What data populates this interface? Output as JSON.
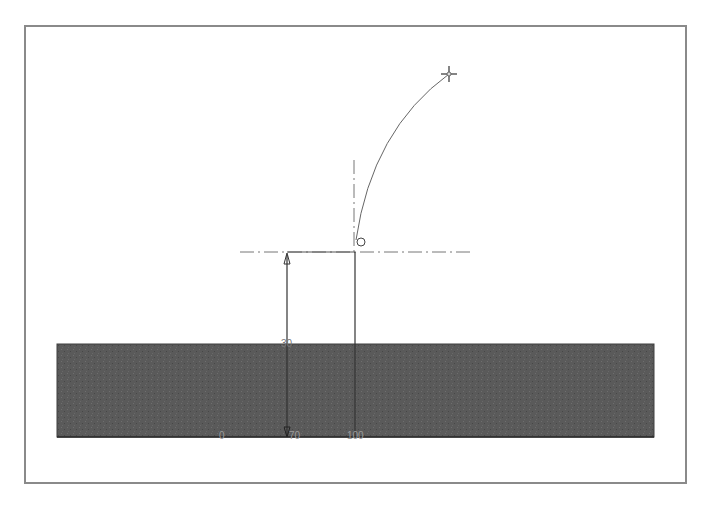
{
  "drawing": {
    "type": "cad-sketch",
    "colors": {
      "frame": "#8a8a8a",
      "ground_fill": "#5a5a5a",
      "line": "#444444",
      "centerline": "#777777",
      "label": "#9a9a9a"
    },
    "ground_block": {
      "x": 57,
      "y": 344,
      "width": 597,
      "height": 93
    },
    "centerline_horizontal": {
      "x1": 240,
      "x2": 470,
      "y": 252
    },
    "centerline_vertical": {
      "x": 354,
      "y1": 160,
      "y2": 252
    },
    "arc": {
      "start": [
        356,
        240
      ],
      "end": [
        449,
        74
      ]
    },
    "endpoint_marker": {
      "x": 449,
      "y": 74
    },
    "start_marker": {
      "x": 361,
      "y": 242
    },
    "dimension_vertical": {
      "x": 287,
      "y_top": 253,
      "y_bottom": 437,
      "label": "30"
    },
    "reference_line_vertical": {
      "x": 355,
      "y_top": 252,
      "y_bottom": 437
    },
    "axis_labels": [
      {
        "text": "0",
        "x": 219,
        "y": 431
      },
      {
        "text": "70",
        "x": 289,
        "y": 431
      },
      {
        "text": "100",
        "x": 347,
        "y": 431
      }
    ]
  },
  "caption": ""
}
